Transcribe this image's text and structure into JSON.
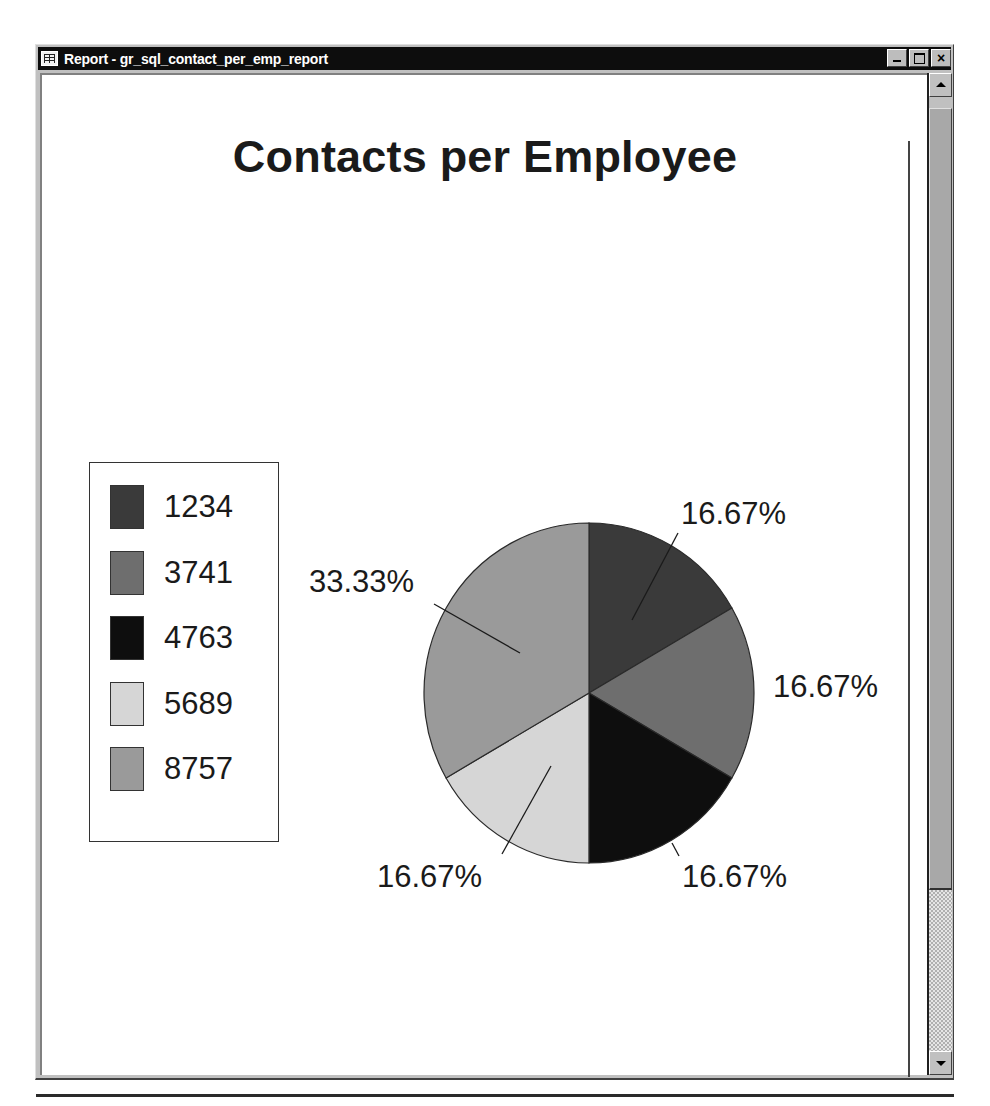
{
  "window": {
    "title": "Report - gr_sql_contact_per_emp_report",
    "icon": "report-table-icon",
    "buttons": {
      "minimize": "minimize-icon",
      "maximize": "maximize-icon",
      "close_label": "×"
    }
  },
  "scrollbar": {
    "up": "scroll-up-arrow",
    "down": "scroll-down-arrow"
  },
  "chart_data": {
    "type": "pie",
    "title": "Contacts per Employee",
    "categories": [
      "1234",
      "3741",
      "4763",
      "5689",
      "8757"
    ],
    "values": [
      16.67,
      16.67,
      16.67,
      16.67,
      33.33
    ],
    "labels": [
      "16.67%",
      "16.67%",
      "16.67%",
      "16.67%",
      "33.33%"
    ],
    "colors": [
      "#3a3a3a",
      "#6e6e6e",
      "#0e0e0e",
      "#d6d6d6",
      "#9a9a9a"
    ],
    "legend_position": "left",
    "start_angle": "12 o'clock, clockwise"
  }
}
